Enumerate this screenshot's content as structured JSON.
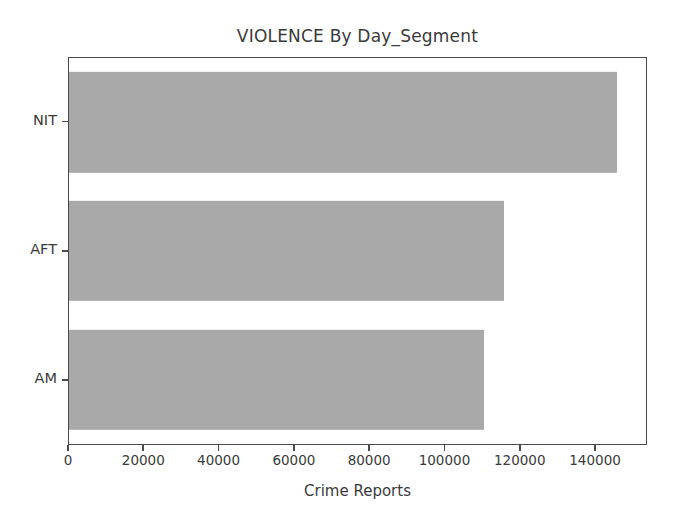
{
  "chart_data": {
    "type": "bar",
    "orientation": "horizontal",
    "title": "VIOLENCE By Day_Segment",
    "xlabel": "Crime Reports",
    "ylabel": "",
    "categories": [
      "AM",
      "AFT",
      "NIT"
    ],
    "values": [
      110500,
      116000,
      146000
    ],
    "xlim": [
      0,
      153800
    ],
    "xticks": [
      0,
      20000,
      40000,
      60000,
      80000,
      100000,
      120000,
      140000
    ],
    "xticklabels": [
      "0",
      "20000",
      "40000",
      "60000",
      "80000",
      "100000",
      "120000",
      "140000"
    ],
    "yticklabels_top_to_bottom": [
      "NIT",
      "AFT",
      "AM"
    ],
    "grid": false,
    "legend": null,
    "bar_color": "#a9a9a9",
    "axes_color": "#4a4a4a",
    "text_color": "#3a3a3a",
    "background": "#ffffff",
    "series": [
      {
        "name": "Crime Reports",
        "points": [
          {
            "category": "NIT",
            "value": 146000
          },
          {
            "category": "AFT",
            "value": 116000
          },
          {
            "category": "AM",
            "value": 110500
          }
        ]
      }
    ]
  }
}
